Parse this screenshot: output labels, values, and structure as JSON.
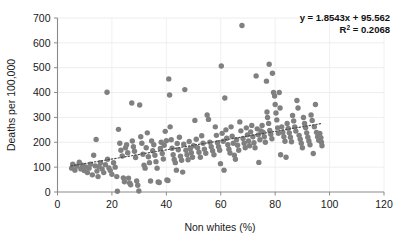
{
  "chart_data": {
    "type": "scatter",
    "title": "",
    "xlabel": "Non whites (%)",
    "ylabel": "Deaths per 100,000",
    "xlim": [
      0,
      120
    ],
    "ylim": [
      0,
      700
    ],
    "xticks": [
      0,
      20,
      40,
      60,
      80,
      100,
      120
    ],
    "yticks": [
      0,
      100,
      200,
      300,
      400,
      500,
      600,
      700
    ],
    "grid": true,
    "legend": "none",
    "marker_color": "#808080",
    "marker_size": 5.4,
    "annotations": {
      "equation": "y = 1.8543x + 95.562",
      "r_squared_label": "R",
      "r_squared_exponent": "2",
      "r_squared_value": " = 0.2068"
    },
    "trendline": {
      "type": "dotted-linear",
      "slope": 1.8543,
      "intercept": 95.562,
      "x_start": 5,
      "x_end": 97,
      "color": "#4d4d4d"
    },
    "points": [
      [
        5.2,
        96
      ],
      [
        5.6,
        112
      ],
      [
        6.4,
        88
      ],
      [
        7.1,
        104
      ],
      [
        8.0,
        120
      ],
      [
        8.6,
        93
      ],
      [
        9.2,
        108
      ],
      [
        9.8,
        86
      ],
      [
        10.4,
        101
      ],
      [
        11.0,
        78
      ],
      [
        11.6,
        96
      ],
      [
        12.2,
        112
      ],
      [
        12.8,
        69
      ],
      [
        13.3,
        148
      ],
      [
        13.9,
        105
      ],
      [
        14.2,
        211
      ],
      [
        14.5,
        84
      ],
      [
        14.9,
        62
      ],
      [
        15.3,
        102
      ],
      [
        15.8,
        118
      ],
      [
        16.4,
        93
      ],
      [
        17.0,
        78
      ],
      [
        17.6,
        110
      ],
      [
        18.2,
        401
      ],
      [
        18.4,
        132
      ],
      [
        18.9,
        97
      ],
      [
        19.4,
        86
      ],
      [
        20.0,
        71
      ],
      [
        20.6,
        118
      ],
      [
        21.2,
        100
      ],
      [
        21.8,
        62
      ],
      [
        22.0,
        3
      ],
      [
        22.4,
        252
      ],
      [
        22.9,
        196
      ],
      [
        23.3,
        168
      ],
      [
        23.8,
        145
      ],
      [
        24.2,
        57
      ],
      [
        24.6,
        41
      ],
      [
        25.0,
        178
      ],
      [
        25.4,
        190
      ],
      [
        25.8,
        158
      ],
      [
        26.1,
        56
      ],
      [
        26.5,
        36
      ],
      [
        26.9,
        29
      ],
      [
        27.3,
        358
      ],
      [
        27.5,
        205
      ],
      [
        27.9,
        182
      ],
      [
        28.3,
        164
      ],
      [
        28.7,
        139
      ],
      [
        29.1,
        44
      ],
      [
        29.5,
        27
      ],
      [
        29.9,
        4
      ],
      [
        30.2,
        350
      ],
      [
        30.6,
        222
      ],
      [
        31.0,
        196
      ],
      [
        31.4,
        152
      ],
      [
        31.8,
        108
      ],
      [
        32.2,
        96
      ],
      [
        32.6,
        178
      ],
      [
        33.0,
        238
      ],
      [
        33.4,
        142
      ],
      [
        33.8,
        118
      ],
      [
        34.2,
        44
      ],
      [
        34.6,
        205
      ],
      [
        35.0,
        166
      ],
      [
        35.4,
        190
      ],
      [
        35.8,
        148
      ],
      [
        36.2,
        122
      ],
      [
        36.6,
        96
      ],
      [
        37.0,
        40
      ],
      [
        37.4,
        38
      ],
      [
        37.8,
        175
      ],
      [
        38.1,
        200
      ],
      [
        38.5,
        155
      ],
      [
        38.9,
        133
      ],
      [
        39.2,
        188
      ],
      [
        39.6,
        244
      ],
      [
        40.0,
        206
      ],
      [
        40.2,
        48
      ],
      [
        40.6,
        46
      ],
      [
        40.9,
        455
      ],
      [
        41.2,
        390
      ],
      [
        41.4,
        262
      ],
      [
        41.8,
        210
      ],
      [
        42.1,
        176
      ],
      [
        42.5,
        150
      ],
      [
        42.9,
        131
      ],
      [
        43.3,
        118
      ],
      [
        43.7,
        88
      ],
      [
        44.0,
        195
      ],
      [
        44.4,
        170
      ],
      [
        44.8,
        220
      ],
      [
        45.2,
        144
      ],
      [
        45.6,
        128
      ],
      [
        46.0,
        80
      ],
      [
        46.4,
        192
      ],
      [
        46.8,
        412
      ],
      [
        47.2,
        168
      ],
      [
        47.6,
        150
      ],
      [
        48.0,
        130
      ],
      [
        48.4,
        203
      ],
      [
        48.8,
        175
      ],
      [
        49.2,
        158
      ],
      [
        49.6,
        140
      ],
      [
        50.0,
        186
      ],
      [
        50.5,
        288
      ],
      [
        51.0,
        212
      ],
      [
        51.5,
        178
      ],
      [
        52.0,
        160
      ],
      [
        52.5,
        140
      ],
      [
        53.0,
        226
      ],
      [
        53.5,
        196
      ],
      [
        54.0,
        172
      ],
      [
        54.5,
        156
      ],
      [
        55.0,
        310
      ],
      [
        55.5,
        292
      ],
      [
        56.0,
        200
      ],
      [
        56.5,
        182
      ],
      [
        57.0,
        166
      ],
      [
        57.5,
        150
      ],
      [
        58.0,
        262
      ],
      [
        58.4,
        228
      ],
      [
        58.8,
        198
      ],
      [
        59.2,
        182
      ],
      [
        59.6,
        168
      ],
      [
        59.9,
        114
      ],
      [
        60.2,
        507
      ],
      [
        60.5,
        236
      ],
      [
        60.9,
        204
      ],
      [
        61.2,
        88
      ],
      [
        61.5,
        378
      ],
      [
        61.9,
        250
      ],
      [
        62.2,
        216
      ],
      [
        62.6,
        190
      ],
      [
        63.0,
        172
      ],
      [
        63.4,
        157
      ],
      [
        63.8,
        262
      ],
      [
        64.2,
        224
      ],
      [
        64.6,
        196
      ],
      [
        65.0,
        148
      ],
      [
        65.4,
        132
      ],
      [
        65.8,
        210
      ],
      [
        66.2,
        188
      ],
      [
        66.6,
        168
      ],
      [
        67.0,
        282
      ],
      [
        67.4,
        246
      ],
      [
        67.8,
        670
      ],
      [
        68.2,
        215
      ],
      [
        68.6,
        196
      ],
      [
        69.0,
        178
      ],
      [
        69.4,
        258
      ],
      [
        69.8,
        230
      ],
      [
        70.2,
        205
      ],
      [
        70.6,
        186
      ],
      [
        71.0,
        242
      ],
      [
        71.4,
        268
      ],
      [
        71.8,
        222
      ],
      [
        72.2,
        198
      ],
      [
        72.6,
        178
      ],
      [
        73.0,
        467
      ],
      [
        73.4,
        254
      ],
      [
        73.8,
        230
      ],
      [
        74.0,
        119
      ],
      [
        74.4,
        210
      ],
      [
        74.8,
        246
      ],
      [
        75.2,
        268
      ],
      [
        75.6,
        240
      ],
      [
        76.0,
        222
      ],
      [
        76.4,
        200
      ],
      [
        76.8,
        446
      ],
      [
        77.0,
        322
      ],
      [
        77.2,
        300
      ],
      [
        77.6,
        276
      ],
      [
        77.8,
        514
      ],
      [
        78.0,
        248
      ],
      [
        78.4,
        232
      ],
      [
        78.8,
        214
      ],
      [
        79.0,
        478
      ],
      [
        79.4,
        400
      ],
      [
        79.8,
        386
      ],
      [
        80.0,
        352
      ],
      [
        80.3,
        318
      ],
      [
        80.6,
        290
      ],
      [
        80.9,
        258
      ],
      [
        81.2,
        236
      ],
      [
        81.5,
        400
      ],
      [
        81.8,
        338
      ],
      [
        82.0,
        150
      ],
      [
        82.4,
        262
      ],
      [
        82.8,
        240
      ],
      [
        83.2,
        222
      ],
      [
        83.6,
        204
      ],
      [
        84.0,
        140
      ],
      [
        84.4,
        276
      ],
      [
        84.8,
        256
      ],
      [
        85.2,
        238
      ],
      [
        85.6,
        220
      ],
      [
        86.0,
        202
      ],
      [
        86.4,
        308
      ],
      [
        86.8,
        286
      ],
      [
        87.2,
        262
      ],
      [
        87.6,
        245
      ],
      [
        88.0,
        368
      ],
      [
        88.4,
        338
      ],
      [
        88.8,
        228
      ],
      [
        89.2,
        212
      ],
      [
        89.6,
        196
      ],
      [
        90.0,
        178
      ],
      [
        90.4,
        300
      ],
      [
        90.8,
        276
      ],
      [
        91.2,
        258
      ],
      [
        91.6,
        238
      ],
      [
        92.0,
        220
      ],
      [
        92.4,
        205
      ],
      [
        92.8,
        190
      ],
      [
        93.2,
        310
      ],
      [
        93.6,
        288
      ],
      [
        94.0,
        155
      ],
      [
        94.4,
        262
      ],
      [
        94.8,
        352
      ],
      [
        95.2,
        240
      ],
      [
        95.6,
        222
      ],
      [
        96.0,
        208
      ],
      [
        96.4,
        236
      ],
      [
        96.8,
        218
      ],
      [
        97.0,
        200
      ],
      [
        97.2,
        186
      ]
    ]
  }
}
